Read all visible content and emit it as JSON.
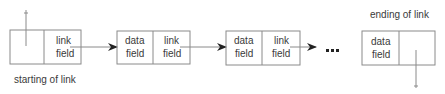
{
  "diagram": {
    "type": "linked-list",
    "labels": {
      "start": "starting of link",
      "end": "ending of link",
      "ellipsis": "•••"
    },
    "nodes": [
      {
        "id": "head",
        "data_line1": "",
        "data_line2": "",
        "link_line1": "link",
        "link_line2": "field"
      },
      {
        "id": "node-1",
        "data_line1": "data",
        "data_line2": "field",
        "link_line1": "link",
        "link_line2": "field"
      },
      {
        "id": "node-2",
        "data_line1": "data",
        "data_line2": "field",
        "link_line1": "link",
        "link_line2": "field"
      },
      {
        "id": "tail",
        "data_line1": "data",
        "data_line2": "field",
        "link_line1": "",
        "link_line2": ""
      }
    ],
    "colors": {
      "stroke": "#8a8a8a",
      "text": "#3a3a3a",
      "arrow": "#222222"
    }
  }
}
